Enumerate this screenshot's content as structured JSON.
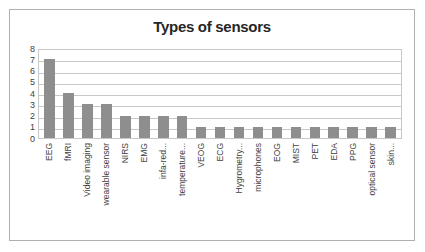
{
  "chart_data": {
    "type": "bar",
    "title": "Types of sensors",
    "xlabel": "",
    "ylabel": "",
    "ylim": [
      0,
      8
    ],
    "yticks": [
      8,
      7,
      6,
      5,
      4,
      3,
      2,
      1,
      0
    ],
    "grid": true,
    "legend": "none",
    "bar_color": "#8e8e8e",
    "categories": [
      "EEG",
      "fMRI",
      "Video imaging",
      "wearable sensor",
      "NIRS",
      "EMG",
      "infa-red...",
      "temperature...",
      "VEOG",
      "ECG",
      "Hygrometry...",
      "microphones",
      "EOG",
      "MIST",
      "PET",
      "EDA",
      "PPG",
      "optical sensor",
      "skin..."
    ],
    "values": [
      7,
      4,
      3,
      3,
      2,
      2,
      2,
      2,
      1,
      1,
      1,
      1,
      1,
      1,
      1,
      1,
      1,
      1,
      1
    ]
  }
}
